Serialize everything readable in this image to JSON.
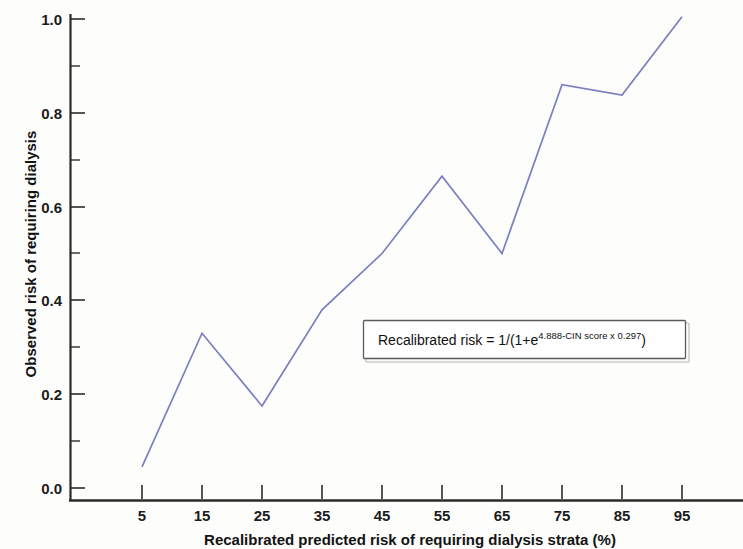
{
  "chart_data": {
    "type": "line",
    "title": "",
    "xlabel": "Recalibrated predicted risk of requiring dialysis strata (%)",
    "ylabel": "Observed risk of requiring dialysis",
    "x": [
      5,
      15,
      25,
      35,
      45,
      55,
      65,
      75,
      85,
      95
    ],
    "values": [
      0.045,
      0.33,
      0.175,
      0.38,
      0.5,
      0.665,
      0.5,
      0.86,
      0.838,
      1.005
    ],
    "series": [
      {
        "name": "Observed risk",
        "color": "#7a7fc0",
        "values": [
          0.045,
          0.33,
          0.175,
          0.38,
          0.5,
          0.665,
          0.5,
          0.86,
          0.838,
          1.005
        ]
      }
    ],
    "categories": [
      "5",
      "15",
      "25",
      "35",
      "45",
      "55",
      "65",
      "75",
      "85",
      "95"
    ],
    "xlim": [
      0,
      100
    ],
    "ylim": [
      0.0,
      1.04
    ],
    "xticks": [
      5,
      15,
      25,
      35,
      45,
      55,
      65,
      75,
      85,
      95
    ],
    "xtick_labels": [
      "5",
      "15",
      "25",
      "35",
      "45",
      "55",
      "65",
      "75",
      "85",
      "95"
    ],
    "yticks": [
      0.0,
      0.2,
      0.4,
      0.6,
      0.8,
      1.0
    ],
    "ytick_labels": [
      "0.0",
      "0.2",
      "0.4",
      "0.6",
      "0.8",
      "1.0"
    ],
    "yticks_minor": [
      0.1,
      0.3,
      0.5,
      0.7,
      0.9
    ],
    "grid": false,
    "legend": null,
    "annotations": [
      {
        "name": "recalibration-formula",
        "prefix": "Recalibrated risk = 1/(1+e",
        "superscript": "4.888-CIN score x 0.297",
        "suffix": ")",
        "full_text": "Recalibrated risk = 1/(1+e4.888-CIN score x 0.297 )"
      }
    ]
  },
  "axes": {
    "y_title": "Observed risk of requiring dialysis",
    "x_title": "Recalibrated predicted risk of requiring dialysis strata (%)"
  },
  "colors": {
    "line": "#7a7fc0",
    "axis": "#2b2b2b",
    "text": "#131313",
    "annotation_border": "#5a5a5a",
    "background": "#fdfdfc"
  }
}
